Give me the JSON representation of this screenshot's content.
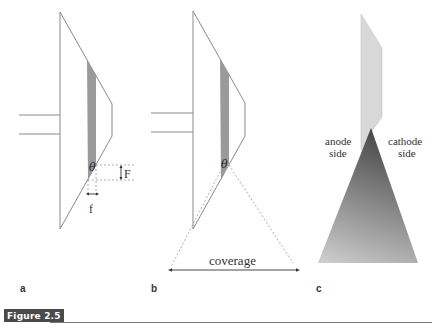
{
  "figure": {
    "caption_label": "Figure 2.5",
    "panels": [
      {
        "id": "a",
        "label": "a",
        "annotations": {
          "angle": "θ",
          "focal_height": "F",
          "focal_width": "f"
        }
      },
      {
        "id": "b",
        "label": "b",
        "annotations": {
          "angle": "θ",
          "coverage": "coverage"
        }
      },
      {
        "id": "c",
        "label": "c",
        "annotations": {
          "left_side_line1": "anode",
          "left_side_line2": "side",
          "right_side_line1": "cathode",
          "right_side_line2": "side"
        }
      }
    ]
  },
  "colors": {
    "outline": "#8a8a8a",
    "target_strip": "#999999",
    "anode_light": "#d6d6d6",
    "beam_dark": "#4a4a4a",
    "beam_light": "#c4c4c4",
    "caption_bg": "#4a4a4a"
  }
}
